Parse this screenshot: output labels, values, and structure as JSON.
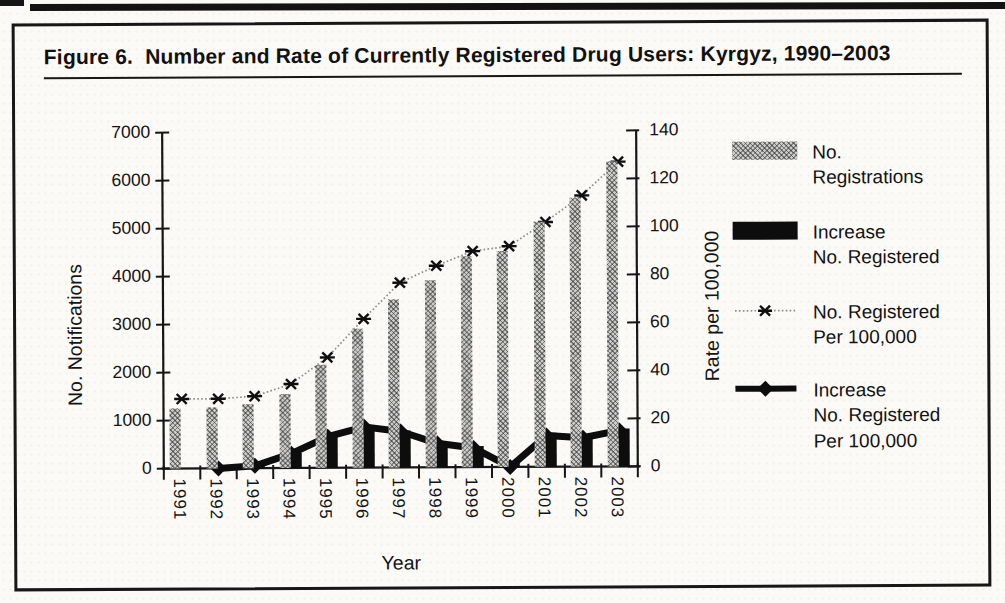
{
  "figure": {
    "title": "Figure 6.  Number and Rate of Currently Registered Drug Users: Kyrgyz, 1990–2003"
  },
  "chart_data": {
    "type": "combo-bar-line",
    "title": "Figure 6.  Number and Rate of Currently Registered Drug Users: Kyrgyz, 1990–2003",
    "categories": [
      1991,
      1992,
      1993,
      1994,
      1995,
      1996,
      1997,
      1998,
      1999,
      2000,
      2001,
      2002,
      2003
    ],
    "series": [
      {
        "name": "No. Registrations",
        "type": "bar",
        "axis": "left",
        "values": [
          1250,
          1270,
          1330,
          1550,
          2150,
          2900,
          3500,
          3900,
          4400,
          4500,
          5100,
          5600,
          6350
        ]
      },
      {
        "name": "Increase No. Registered",
        "type": "bar",
        "axis": "left",
        "values": [
          null,
          20,
          70,
          320,
          660,
          880,
          780,
          470,
          440,
          80,
          700,
          580,
          790
        ]
      },
      {
        "name": "No. Registered Per 100,000",
        "type": "line",
        "marker": "star",
        "axis": "right",
        "values": [
          29,
          29,
          30,
          35,
          46,
          62,
          77,
          84,
          90,
          92,
          102,
          113,
          127
        ]
      },
      {
        "name": "Increase No. Registered Per 100,000",
        "type": "line",
        "marker": "diamond",
        "axis": "right",
        "values": [
          null,
          0,
          1,
          6,
          13,
          17,
          15,
          10,
          8,
          0,
          13,
          12,
          15
        ]
      }
    ],
    "left_axis": {
      "title": "No. Notifications",
      "min": 0,
      "max": 7000,
      "step": 1000
    },
    "right_axis": {
      "title": "Rate per 100,000",
      "min": 0,
      "max": 140,
      "step": 20
    },
    "x_axis": {
      "title": "Year"
    },
    "grid": false,
    "legend_position": "right"
  },
  "legend": {
    "items": [
      {
        "swatch": "gray-hatched-bar",
        "label": "No.\nRegistrations"
      },
      {
        "swatch": "black-bar",
        "label": "Increase\nNo. Registered"
      },
      {
        "swatch": "dotted-line-star-marker",
        "label": "No. Registered\nPer 100,000"
      },
      {
        "swatch": "thick-line-diamond-marker",
        "label": "Increase\nNo. Registered\nPer 100,000"
      }
    ]
  },
  "colors": {
    "ink": "#161616",
    "bar_gray": "#cbcbc9",
    "bar_black": "#0d0d0d",
    "rate_line_gray": "#8d8d8d"
  }
}
